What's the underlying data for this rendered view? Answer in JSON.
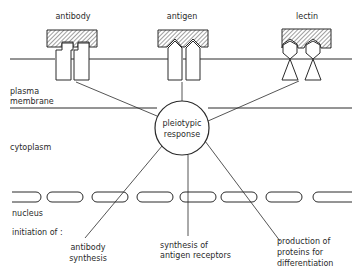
{
  "receptors": {
    "antibody": "antibody",
    "antigen": "antigen",
    "lectin": "lectin"
  },
  "regions": {
    "plasma_membrane_line1": "plasma",
    "plasma_membrane_line2": "membrane",
    "cytoplasm": "cytoplasm",
    "nucleus": "nucleus",
    "initiation": "initiation of :"
  },
  "center": {
    "line1": "pleiotypic",
    "line2": "response"
  },
  "outcomes": {
    "antibody_synthesis": [
      "antibody",
      "synthesis"
    ],
    "antigen_receptors": [
      "synthesis of",
      "antigen receptors"
    ],
    "differentiation": [
      "production of",
      "proteins for",
      "differentiation"
    ]
  },
  "colors": {
    "ink": "#2a2a2a",
    "background": "#ffffff"
  }
}
